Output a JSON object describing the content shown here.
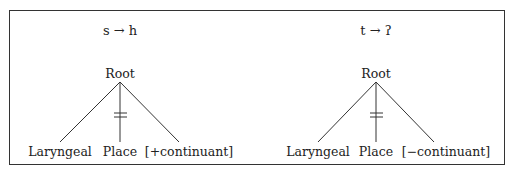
{
  "panels": [
    {
      "rule": "s → h",
      "root": "Root",
      "children": [
        "Laryngeal",
        "Place",
        "[+continuant]"
      ],
      "delinked": "Place"
    },
    {
      "rule": "t → ʔ",
      "root": "Root",
      "children": [
        "Laryngeal",
        "Place",
        "[−continuant]"
      ],
      "delinked": "Place"
    }
  ]
}
